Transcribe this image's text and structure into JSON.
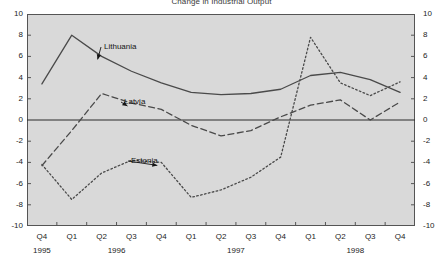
{
  "chart_data": {
    "type": "line",
    "title": "Change in Industrial Output",
    "xlabel": "",
    "ylabel": "",
    "ylim": [
      -10,
      10
    ],
    "yticks": [
      10,
      8,
      6,
      4,
      2,
      0,
      -2,
      -4,
      -6,
      -8,
      -10
    ],
    "ytick_labels_left": [
      "10",
      "8",
      "6",
      "4",
      "2",
      "0",
      "-2",
      "-4",
      "-6",
      "-8",
      "-10"
    ],
    "ytick_labels_right": [
      "10",
      "8",
      "6",
      "4",
      "2",
      "0",
      "-2",
      "-4",
      "-6",
      "-8",
      "-10"
    ],
    "grid": false,
    "zero_line": true,
    "legend_position": "inline-annotation",
    "categories": [
      "Q4",
      "Q1",
      "Q2",
      "Q3",
      "Q4",
      "Q1",
      "Q2",
      "Q3",
      "Q4",
      "Q1",
      "Q2",
      "Q3",
      "Q4"
    ],
    "year_groups": [
      {
        "label": "1995",
        "start_index": 0,
        "end_index": 0
      },
      {
        "label": "1996",
        "start_index": 1,
        "end_index": 4
      },
      {
        "label": "1997",
        "start_index": 5,
        "end_index": 8
      },
      {
        "label": "1998",
        "start_index": 9,
        "end_index": 12
      }
    ],
    "series": [
      {
        "name": "Lithuania",
        "style": "solid",
        "color": "#4a4a4a",
        "values": [
          3.4,
          8.0,
          6.0,
          4.6,
          3.5,
          2.6,
          2.4,
          2.5,
          2.9,
          4.2,
          4.5,
          3.8,
          2.6
        ],
        "label_x": 104,
        "label_y": 43
      },
      {
        "name": "Latvia",
        "style": "dashed",
        "color": "#4a4a4a",
        "values": [
          -4.3,
          -1.0,
          2.5,
          1.6,
          1.0,
          -0.5,
          -1.5,
          -1.0,
          0.3,
          1.4,
          1.9,
          0.0,
          1.7
        ],
        "label_x": 124,
        "label_y": 98
      },
      {
        "name": "Estonia",
        "style": "dotted",
        "color": "#4a4a4a",
        "values": [
          -4.2,
          -7.5,
          -5.0,
          -3.8,
          -4.0,
          -7.3,
          -6.6,
          -5.4,
          -3.5,
          7.8,
          3.5,
          2.3,
          3.6
        ],
        "label_x": 131,
        "label_y": 157
      }
    ],
    "annotations": [
      {
        "text": "Lithuania",
        "points_to_index": 2
      },
      {
        "text": "Latvia",
        "points_to_index": 3
      },
      {
        "text": "Estonia",
        "points_to_index": 4
      }
    ],
    "colors": {
      "plot_background": "#d9d9d9",
      "page_background": "#ffffff",
      "axis": "#555555",
      "line": "#4a4a4a",
      "text": "#1d1d1d"
    }
  }
}
